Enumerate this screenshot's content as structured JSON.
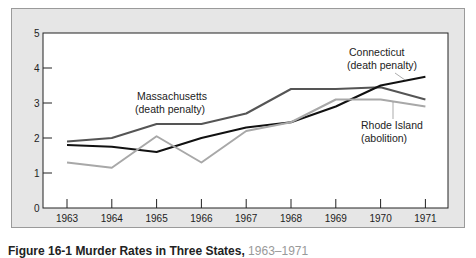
{
  "chart_data": {
    "type": "line",
    "title": "",
    "xlabel": "",
    "ylabel": "",
    "x": [
      "1963",
      "1964",
      "1965",
      "1966",
      "1967",
      "1968",
      "1969",
      "1970",
      "1971"
    ],
    "yticks": [
      "0",
      "1",
      "2",
      "3",
      "4",
      "5"
    ],
    "ylim": [
      0,
      5
    ],
    "grid": false,
    "legend": "inline annotations",
    "series": [
      {
        "name": "Massachusetts (death penalty)",
        "color": "#555555",
        "values": [
          1.9,
          2.0,
          2.4,
          2.4,
          2.7,
          3.4,
          3.4,
          3.45,
          3.1
        ]
      },
      {
        "name": "Connecticut (death penalty)",
        "color": "#111111",
        "values": [
          1.8,
          1.75,
          1.6,
          2.0,
          2.3,
          2.45,
          2.9,
          3.5,
          3.75
        ]
      },
      {
        "name": "Rhode Island (abolition)",
        "color": "#a8a8a8",
        "values": [
          1.3,
          1.15,
          2.05,
          1.3,
          2.2,
          2.45,
          3.1,
          3.1,
          2.9
        ]
      }
    ],
    "annotations": [
      {
        "line1": "Massachusetts",
        "line2": "(death penalty)"
      },
      {
        "line1": "Connecticut",
        "line2": "(death penalty)"
      },
      {
        "line1": "Rhode Island",
        "line2": "(abolition)"
      }
    ]
  },
  "caption": {
    "label": "Figure 16-1",
    "title": "Murder Rates in Three States,",
    "years": "1963–1971"
  }
}
